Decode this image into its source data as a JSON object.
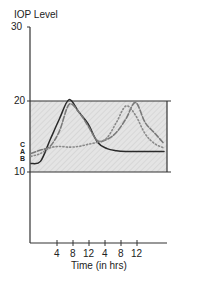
{
  "chart_data": {
    "type": "line",
    "title": "",
    "ylabel": "IOP Level",
    "xlabel": "Time (in hrs)",
    "ylim": [
      7,
      30
    ],
    "yticks": [
      10,
      20,
      30
    ],
    "xtick_labels": [
      "4",
      "8",
      "12",
      "4",
      "8",
      "12"
    ],
    "shaded_band": {
      "from": 10,
      "to": 20.5,
      "pattern": "diagonal-hatch"
    },
    "grid": false,
    "legend": {
      "position": "inline-left",
      "entries": [
        "C",
        "A",
        "B"
      ]
    },
    "x": [
      0,
      2,
      4,
      6,
      8,
      10,
      12,
      14,
      16,
      18,
      20,
      22,
      24,
      26,
      28
    ],
    "series": [
      {
        "name": "A",
        "style": "solid",
        "values": [
          11.2,
          11.5,
          14.5,
          17.5,
          20.2,
          18.5,
          16.8,
          14.2,
          13.3,
          13.0,
          12.9,
          12.9,
          12.9,
          12.9,
          12.9
        ]
      },
      {
        "name": "C",
        "style": "dashed",
        "values": [
          12.6,
          13.1,
          13.6,
          15.8,
          19.5,
          18.5,
          16.5,
          14.4,
          14.6,
          15.6,
          17.5,
          19.8,
          17.0,
          15.5,
          14.0
        ]
      },
      {
        "name": "B",
        "style": "dotted",
        "values": [
          12.2,
          12.6,
          13.4,
          13.6,
          13.5,
          13.6,
          13.9,
          14.2,
          14.8,
          17.0,
          19.3,
          18.0,
          15.4,
          14.0,
          13.4
        ]
      }
    ]
  }
}
